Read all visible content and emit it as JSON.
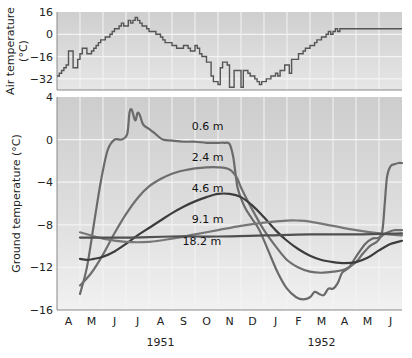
{
  "chart_data": [
    {
      "type": "line",
      "title": "",
      "ylabel": "Air temperature (°C)",
      "ylabel_lines": [
        "Air temperature",
        "(°C)"
      ],
      "ylim": [
        -40,
        16
      ],
      "yticks": [
        16,
        0,
        -16,
        -32
      ],
      "ytick_labels": [
        "16",
        "0",
        "−16",
        "−32"
      ],
      "grid": true,
      "step": true,
      "series": [
        {
          "name": "Air temperature",
          "x": [
            0.0,
            0.1,
            0.2,
            0.3,
            0.4,
            0.5,
            0.6,
            0.7,
            0.8,
            0.9,
            1.0,
            1.1,
            1.2,
            1.3,
            1.4,
            1.5,
            1.6,
            1.7,
            1.8,
            1.9,
            2.0,
            2.1,
            2.2,
            2.3,
            2.4,
            2.5,
            2.6,
            2.7,
            2.8,
            2.9,
            3.0,
            3.1,
            3.2,
            3.3,
            3.4,
            3.5,
            3.6,
            3.7,
            3.8,
            3.9,
            4.0,
            4.1,
            4.2,
            4.3,
            4.4,
            4.5,
            4.6,
            4.7,
            4.8,
            4.9,
            5.0,
            5.1,
            5.2,
            5.3,
            5.4,
            5.5,
            5.6,
            5.7,
            5.8,
            5.9,
            6.0,
            6.1,
            6.2,
            6.3,
            6.4,
            6.5,
            6.6,
            6.7,
            6.8,
            6.9,
            7.0,
            7.1,
            7.2,
            7.3,
            7.4,
            7.5,
            7.6,
            7.7,
            7.8,
            7.9,
            8.0,
            8.1,
            8.2,
            8.3,
            8.4,
            8.5,
            8.6,
            8.7,
            8.8,
            8.9,
            9.0,
            9.1,
            9.2,
            9.3,
            9.4,
            9.5,
            9.6,
            9.7,
            9.8,
            9.9,
            10.0,
            10.1,
            10.2,
            10.3,
            10.4,
            10.5,
            10.6,
            10.7,
            10.8,
            10.9,
            11.0,
            11.1,
            11.2,
            11.3,
            11.4,
            11.5,
            11.6,
            11.7,
            11.8,
            11.9,
            12.0,
            12.1,
            12.2,
            12.3,
            12.4,
            12.5,
            12.6,
            12.7,
            12.8,
            12.9,
            13.0,
            13.1,
            13.2,
            13.3,
            13.4,
            13.5,
            13.6,
            13.7,
            13.8,
            13.9,
            14.0,
            14.1,
            14.2,
            14.3,
            14.4,
            14.5,
            14.6,
            14.7,
            14.8,
            14.9,
            15.0
          ],
          "values": [
            -30,
            -28,
            -26,
            -24,
            -22,
            -12,
            -12,
            -24,
            -24,
            -18,
            -14,
            -10,
            -10,
            -14,
            -14,
            -12,
            -10,
            -8,
            -6,
            -4,
            -4,
            -2,
            -2,
            0,
            2,
            4,
            4,
            6,
            8,
            6,
            6,
            10,
            8,
            10,
            12,
            10,
            8,
            6,
            6,
            4,
            2,
            2,
            2,
            0,
            0,
            -2,
            -4,
            -6,
            -6,
            -6,
            -8,
            -8,
            -10,
            -10,
            -10,
            -8,
            -8,
            -10,
            -12,
            -12,
            -8,
            -10,
            -14,
            -16,
            -16,
            -20,
            -20,
            -30,
            -34,
            -34,
            -36,
            -24,
            -20,
            -20,
            -22,
            -38,
            -38,
            -26,
            -26,
            -26,
            -38,
            -26,
            -26,
            -28,
            -30,
            -30,
            -32,
            -34,
            -36,
            -34,
            -34,
            -32,
            -32,
            -30,
            -30,
            -28,
            -30,
            -26,
            -26,
            -22,
            -22,
            -28,
            -18,
            -18,
            -18,
            -14,
            -14,
            -12,
            -10,
            -10,
            -8,
            -8,
            -6,
            -4,
            -4,
            -2,
            -2,
            0,
            2,
            0,
            2,
            4,
            2,
            4,
            4,
            4,
            4,
            4,
            4,
            4,
            4,
            4,
            4,
            4,
            4,
            4,
            4,
            4,
            4,
            4,
            4,
            4,
            4,
            4,
            4,
            4,
            4,
            4,
            4,
            4,
            4,
            4,
            4,
            4
          ]
        }
      ]
    },
    {
      "type": "line",
      "title": "",
      "ylabel": "Ground temperature (°C)",
      "xlabel": "",
      "ylim": [
        -16,
        4
      ],
      "yticks": [
        4,
        0,
        -4,
        -8,
        -12,
        -16
      ],
      "ytick_labels": [
        "4",
        "0",
        "−4",
        "−8",
        "−12",
        "−16"
      ],
      "xlim": [
        0,
        15
      ],
      "categories": [
        "A",
        "M",
        "J",
        "J",
        "A",
        "S",
        "O",
        "N",
        "D",
        "J",
        "F",
        "M",
        "A",
        "M",
        "J"
      ],
      "year_labels": [
        {
          "label": "1951",
          "center_month_index": 4
        },
        {
          "label": "1952",
          "center_month_index": 11
        }
      ],
      "grid": true,
      "series": [
        {
          "name": "0.6 m",
          "x": [
            1.0,
            1.3,
            1.6,
            1.9,
            2.2,
            2.5,
            2.8,
            3.05,
            3.15,
            3.25,
            3.4,
            3.5,
            3.6,
            3.75,
            4.0,
            4.3,
            4.6,
            5.0,
            5.5,
            6.0,
            6.5,
            7.0,
            7.3,
            7.5,
            7.65,
            7.75,
            7.85,
            8.0,
            8.2,
            8.5,
            8.8,
            9.2,
            9.6,
            10.0,
            10.4,
            10.7,
            11.0,
            11.2,
            11.4,
            11.6,
            11.8,
            12.0,
            12.2,
            12.4,
            12.7,
            13.0,
            13.4,
            13.7,
            14.0,
            14.15,
            14.25,
            14.35,
            14.5,
            14.7,
            14.85,
            15.0
          ],
          "values": [
            -14.5,
            -12,
            -8,
            -4,
            -1,
            0,
            0,
            0.5,
            2.5,
            2.8,
            1.8,
            2.5,
            2.3,
            1.4,
            1.0,
            0.5,
            0,
            -0.1,
            -0.2,
            -0.2,
            -0.3,
            -0.3,
            -0.3,
            -0.4,
            -1.5,
            -3,
            -4.5,
            -5.5,
            -6.5,
            -7.5,
            -8.5,
            -10.5,
            -12.5,
            -14,
            -14.8,
            -15,
            -14.8,
            -14.3,
            -14.5,
            -14.6,
            -14,
            -14,
            -13.5,
            -12.5,
            -12,
            -11,
            -9.8,
            -9.3,
            -9.2,
            -8.5,
            -6,
            -3.5,
            -2.5,
            -2.3,
            -2.2,
            -2.2
          ]
        },
        {
          "name": "2.4 m",
          "x": [
            1.0,
            1.5,
            2.0,
            2.5,
            3.0,
            3.5,
            4.0,
            4.5,
            5.0,
            5.5,
            6.0,
            6.5,
            7.0,
            7.5,
            7.8,
            8.0,
            8.3,
            8.6,
            9.0,
            9.5,
            10.0,
            10.5,
            11.0,
            11.5,
            12.0,
            12.5,
            13.0,
            13.3,
            13.6,
            13.9,
            14.1,
            14.3,
            14.5,
            14.7,
            15.0
          ],
          "values": [
            -13.7,
            -12.5,
            -10.8,
            -8.8,
            -7,
            -5.5,
            -4.4,
            -3.7,
            -3.2,
            -2.9,
            -2.7,
            -2.6,
            -2.6,
            -2.8,
            -3.5,
            -4.5,
            -5.8,
            -7,
            -8.5,
            -10,
            -11.3,
            -12,
            -12.4,
            -12.5,
            -12.4,
            -12.2,
            -11.5,
            -10.7,
            -10.0,
            -9.6,
            -9.1,
            -8.8,
            -8.6,
            -8.5,
            -8.5
          ]
        },
        {
          "name": "4.6 m",
          "x": [
            1.0,
            1.3,
            1.6,
            2.0,
            2.5,
            3.0,
            3.5,
            4.0,
            4.5,
            5.0,
            5.5,
            6.0,
            6.5,
            7.0,
            7.5,
            8.0,
            8.5,
            9.0,
            9.5,
            10.0,
            10.5,
            11.0,
            11.5,
            12.0,
            12.5,
            13.0,
            13.5,
            14.0,
            14.5,
            15.0
          ],
          "values": [
            -11.2,
            -11.3,
            -11.2,
            -11.0,
            -10.5,
            -9.8,
            -9.0,
            -8.3,
            -7.6,
            -6.9,
            -6.3,
            -5.8,
            -5.4,
            -5.1,
            -5.1,
            -5.4,
            -6.2,
            -7.3,
            -8.5,
            -9.5,
            -10.3,
            -10.9,
            -11.3,
            -11.5,
            -11.6,
            -11.5,
            -11.1,
            -10.4,
            -9.8,
            -9.5
          ]
        },
        {
          "name": "9.1 m",
          "x": [
            1.0,
            2.0,
            3.0,
            4.0,
            5.0,
            6.0,
            7.0,
            8.0,
            9.0,
            10.0,
            10.5,
            11.0,
            12.0,
            13.0,
            14.0,
            15.0
          ],
          "values": [
            -8.7,
            -9.3,
            -9.6,
            -9.6,
            -9.3,
            -8.9,
            -8.5,
            -8.1,
            -7.8,
            -7.6,
            -7.6,
            -7.7,
            -8.1,
            -8.5,
            -8.8,
            -9.0
          ]
        },
        {
          "name": "18.2 m",
          "x": [
            1.0,
            3.0,
            5.0,
            7.0,
            9.0,
            11.0,
            13.0,
            15.0
          ],
          "values": [
            -9.2,
            -9.2,
            -9.1,
            -9.1,
            -9.0,
            -8.9,
            -8.9,
            -8.8
          ]
        }
      ],
      "curve_labels": [
        {
          "text": "0.6 m",
          "x": 6.55,
          "y": 0.9
        },
        {
          "text": "2.4 m",
          "x": 6.55,
          "y": -2.0
        },
        {
          "text": "4.6 m",
          "x": 6.55,
          "y": -4.9
        },
        {
          "text": "9.1 m",
          "x": 6.55,
          "y": -7.8
        },
        {
          "text": "18.2 m",
          "x": 6.3,
          "y": -9.9
        }
      ]
    }
  ]
}
